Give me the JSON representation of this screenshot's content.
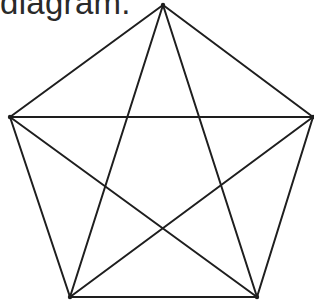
{
  "caption": "diagram.",
  "figure": {
    "shape": "regular pentagon with inscribed pentagram (complete graph K5)",
    "vertices": [
      "top",
      "upper-right",
      "lower-right",
      "lower-left",
      "upper-left"
    ],
    "edges": [
      [
        "top",
        "upper-right"
      ],
      [
        "upper-right",
        "lower-right"
      ],
      [
        "lower-right",
        "lower-left"
      ],
      [
        "lower-left",
        "upper-left"
      ],
      [
        "upper-left",
        "top"
      ],
      [
        "top",
        "lower-right"
      ],
      [
        "top",
        "lower-left"
      ],
      [
        "upper-left",
        "upper-right"
      ],
      [
        "upper-left",
        "lower-right"
      ],
      [
        "upper-right",
        "lower-left"
      ]
    ],
    "line_color": "#1e1e1e"
  }
}
